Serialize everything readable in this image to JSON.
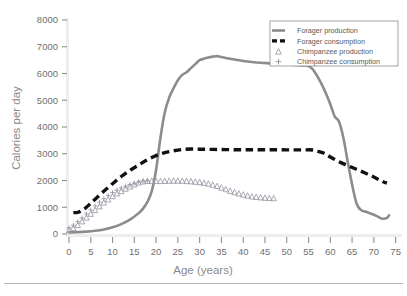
{
  "chart_data": {
    "type": "line",
    "title": "",
    "xlabel": "Age (years)",
    "ylabel": "Calories per day",
    "xlim": [
      0,
      76
    ],
    "ylim": [
      0,
      8000
    ],
    "grid": false,
    "legend_position": "top-right",
    "xticks": [
      0,
      5,
      10,
      15,
      20,
      25,
      30,
      35,
      40,
      45,
      50,
      55,
      60,
      65,
      70,
      75
    ],
    "yticks": [
      0,
      1000,
      2000,
      3000,
      4000,
      5000,
      6000,
      7000,
      8000
    ],
    "xtick_labels": [
      "0",
      "5",
      "10",
      "15",
      "20",
      "25",
      "30",
      "35",
      "40",
      "45",
      "50",
      "55",
      "60",
      "65",
      "70",
      "75"
    ],
    "ytick_labels": [
      "0",
      "1000",
      "2000",
      "3000",
      "4000",
      "5000",
      "6000",
      "7000",
      "8000"
    ],
    "series": [
      {
        "name": "Forager production",
        "style": "solid-line",
        "color": "#8c8c8c",
        "x": [
          0,
          2,
          4,
          6,
          8,
          10,
          12,
          14,
          16,
          17,
          18,
          19,
          20,
          21,
          22,
          23,
          24,
          25,
          26,
          27,
          28,
          29,
          30,
          31,
          32,
          33,
          34,
          35,
          36,
          37,
          38,
          40,
          42,
          44,
          46,
          48,
          50,
          52,
          54,
          55,
          56,
          57,
          58,
          59,
          60,
          61,
          62,
          63,
          64,
          65,
          66,
          67,
          68,
          69,
          70,
          71,
          72,
          73,
          73.5
        ],
        "y": [
          60,
          70,
          90,
          120,
          170,
          250,
          370,
          540,
          780,
          950,
          1200,
          1600,
          2400,
          3600,
          4550,
          5100,
          5450,
          5750,
          5950,
          6050,
          6200,
          6350,
          6500,
          6550,
          6600,
          6630,
          6650,
          6620,
          6580,
          6550,
          6520,
          6470,
          6430,
          6400,
          6380,
          6360,
          6340,
          6320,
          6300,
          6280,
          6150,
          5900,
          5600,
          5250,
          4850,
          4400,
          4200,
          3600,
          2700,
          1850,
          1150,
          900,
          840,
          780,
          720,
          640,
          570,
          600,
          700
        ]
      },
      {
        "name": "Forager consumption",
        "style": "dashed-line",
        "color": "#111111",
        "x": [
          1,
          2,
          3,
          4,
          5,
          6,
          8,
          10,
          12,
          14,
          16,
          18,
          20,
          22,
          24,
          26,
          28,
          30,
          32,
          34,
          36,
          38,
          40,
          42,
          44,
          46,
          48,
          50,
          52,
          54,
          56,
          58,
          59,
          60,
          62,
          64,
          66,
          68,
          70,
          72,
          73
        ],
        "y": [
          800,
          810,
          880,
          1000,
          1150,
          1300,
          1600,
          1880,
          2150,
          2380,
          2580,
          2780,
          2930,
          3040,
          3110,
          3160,
          3175,
          3170,
          3165,
          3160,
          3155,
          3150,
          3150,
          3150,
          3150,
          3150,
          3148,
          3145,
          3145,
          3145,
          3140,
          3050,
          2980,
          2880,
          2700,
          2560,
          2420,
          2280,
          2130,
          1960,
          1900
        ]
      },
      {
        "name": "Chimpanzee production",
        "style": "triangle-markers",
        "color": "#9a9aa5",
        "x": [
          0,
          1,
          2,
          3,
          4,
          5,
          6,
          7,
          8,
          9,
          10,
          11,
          12,
          13,
          14,
          15,
          16,
          17,
          18,
          19,
          20,
          21,
          22,
          23,
          24,
          25,
          26,
          27,
          28,
          29,
          30,
          31,
          32,
          33,
          34,
          35,
          36,
          37,
          38,
          39,
          40,
          41,
          42,
          43,
          44,
          45,
          46,
          47
        ],
        "y": [
          150,
          230,
          340,
          480,
          620,
          760,
          900,
          1040,
          1180,
          1300,
          1420,
          1520,
          1610,
          1700,
          1780,
          1860,
          1930,
          1970,
          1990,
          1995,
          1990,
          1985,
          1990,
          1995,
          2000,
          2000,
          1995,
          1985,
          1975,
          1960,
          1945,
          1920,
          1890,
          1850,
          1800,
          1740,
          1680,
          1620,
          1570,
          1520,
          1480,
          1440,
          1410,
          1390,
          1375,
          1360,
          1350,
          1345
        ]
      },
      {
        "name": "Chimpanzee consumption",
        "style": "plus-markers",
        "color": "#9a9aa5",
        "x": [
          0,
          1,
          2,
          3,
          4,
          5,
          6,
          7,
          8,
          9,
          10,
          11,
          12,
          13,
          14,
          15,
          16,
          17,
          18
        ],
        "y": [
          230,
          330,
          460,
          600,
          750,
          900,
          1050,
          1190,
          1320,
          1440,
          1550,
          1640,
          1720,
          1790,
          1850,
          1900,
          1945,
          1975,
          1990
        ]
      }
    ]
  },
  "legend": {
    "items": [
      {
        "label": "Forager production",
        "marker": "solid-line-swatch"
      },
      {
        "label": "Forager consumption",
        "marker": "dashed-line-swatch"
      },
      {
        "label": "Chimpanzee production",
        "marker": "triangle-swatch"
      },
      {
        "label": "Chimpanzee consumption",
        "marker": "plus-swatch"
      }
    ]
  },
  "colors": {
    "forager_production": "#8c8c8c",
    "forager_consumption": "#111111",
    "chimpanzee": "#9a9aa5",
    "axis": "#e2e2e2",
    "tick_text": "#6f6f6f",
    "axis_title": "#8a8a8a",
    "legend_border": "#8a8a96"
  }
}
